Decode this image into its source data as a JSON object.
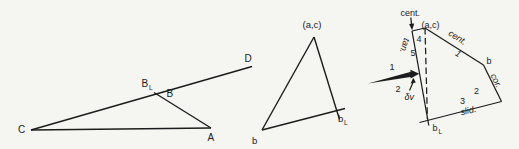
{
  "colors": {
    "ink": "#1c1c1c",
    "background": "#f5f5f2"
  },
  "left": {
    "c": "C",
    "a": "A",
    "d": "D",
    "b": "B",
    "bl": "B",
    "bl_sub": "L"
  },
  "middle": {
    "ac": "(a,c)",
    "b": "b",
    "bl": "b",
    "bl_sub": "L"
  },
  "right": {
    "cent_pointer": "cent.",
    "ac": "(a,c)",
    "b": "b",
    "bl": "b",
    "bl_sub": "L",
    "edge_cent": "cent.",
    "edge_tan": "tan.",
    "edge_cor": "cor.",
    "edge_slid": "slid.",
    "n1": "1",
    "n2": "2",
    "n3": "3",
    "n4": "4",
    "n5": "5",
    "arrow1": "1",
    "arrow2": "2",
    "dv": "δv"
  }
}
